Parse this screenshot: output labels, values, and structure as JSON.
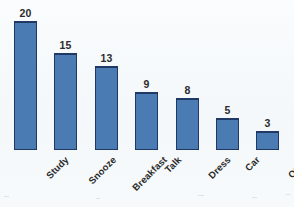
{
  "chart_data": {
    "type": "bar",
    "title": "",
    "subtitle": "",
    "xlabel": "",
    "ylabel": "",
    "categories": [
      "Study",
      "Snooze",
      "Breakfast",
      "Talk",
      "Dress",
      "Car",
      "Other"
    ],
    "values": [
      20,
      15,
      13,
      9,
      8,
      5,
      3
    ],
    "data_labels": [
      "20",
      "15",
      "13",
      "9",
      "8",
      "5",
      "3"
    ],
    "ylim": [
      0,
      20
    ],
    "grid": false,
    "axis_visible": false,
    "legend": null,
    "legend_position": "none",
    "tick_labels_y": [],
    "annotations": [],
    "series": [
      {
        "name": "",
        "values": [
          20,
          15,
          13,
          9,
          8,
          5,
          3
        ]
      }
    ]
  },
  "style": {
    "bar_fill": "#4a7cb3",
    "bar_border": "#1f3864",
    "label_color": "#2b2b2b",
    "background": "#f6fafb",
    "category_label_rotation": "-45"
  }
}
